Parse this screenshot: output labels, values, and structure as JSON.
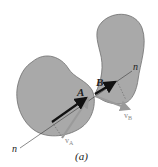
{
  "figure": {
    "caption": "(a)",
    "colors": {
      "body_fill": "#a9a9a9",
      "body_stroke": "#6e6e6e",
      "normal_line": "#3a3a3a",
      "impulse_arrow": "#111111",
      "velocity_arrow": "#9a9a9a",
      "label": "#222222",
      "velocity_label": "#8a8a8a"
    },
    "bodies": [
      {
        "name": "body-A",
        "contact_point_label": "A"
      },
      {
        "name": "body-B",
        "contact_point_label": "B"
      }
    ],
    "normal_axis": {
      "start_label": "n",
      "end_label": "n"
    },
    "velocities": [
      {
        "label": "v",
        "subscript": "A"
      },
      {
        "label": "v",
        "subscript": "B"
      }
    ]
  }
}
